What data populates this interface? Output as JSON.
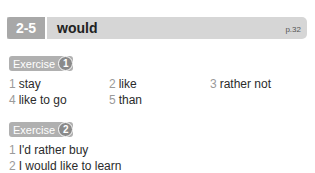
{
  "header": {
    "unit_number": "2-5",
    "title": "would",
    "page": "p.32"
  },
  "exercises": [
    {
      "label": "Exercise",
      "number": "1",
      "answers": [
        {
          "n": "1",
          "text": "stay"
        },
        {
          "n": "2",
          "text": "like"
        },
        {
          "n": "3",
          "text": "rather not"
        },
        {
          "n": "4",
          "text": "like to go"
        },
        {
          "n": "5",
          "text": "than"
        }
      ]
    },
    {
      "label": "Exercise",
      "number": "2",
      "answers": [
        {
          "n": "1",
          "text": "I'd rather buy"
        },
        {
          "n": "2",
          "text": "I would like to learn"
        }
      ]
    }
  ],
  "colors": {
    "header_bg": "#d6d6d6",
    "unit_bg": "#a8a8a8",
    "badge_bg": "#b0b0b0"
  }
}
